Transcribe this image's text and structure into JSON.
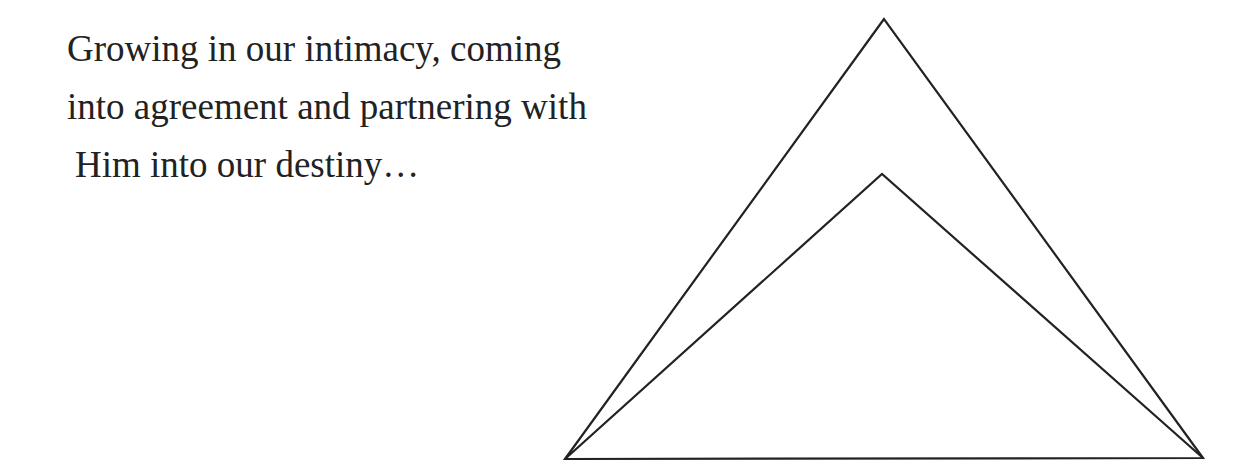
{
  "caption": {
    "lines": [
      "Growing in our intimacy, coming",
      "into agreement and partnering with",
      "Him into our destiny…"
    ]
  },
  "diagram": {
    "shapes": [
      "outer-triangle",
      "inner-triangle"
    ],
    "stroke_color": "#222222"
  }
}
